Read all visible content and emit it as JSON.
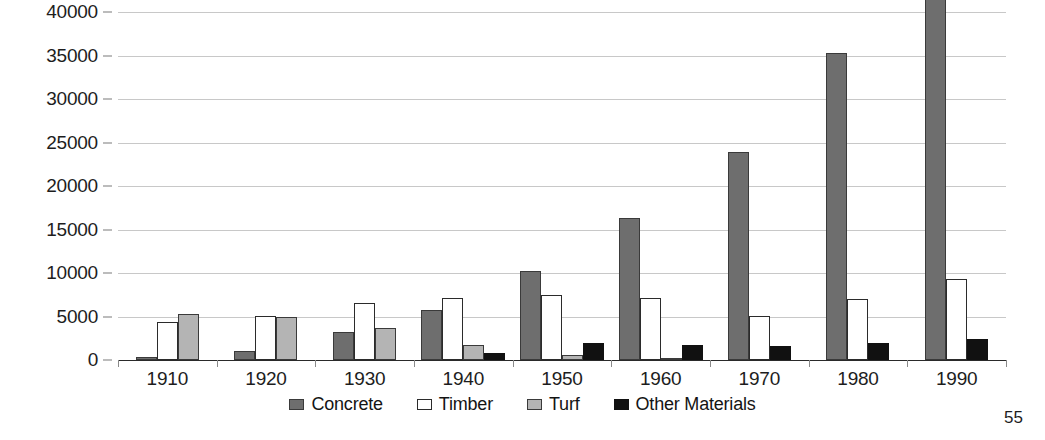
{
  "page": {
    "page_number": "55"
  },
  "chart_data": {
    "type": "bar",
    "title": "",
    "subtitle": "",
    "xlabel": "",
    "ylabel": "",
    "grid": true,
    "legend_position": "bottom",
    "ylim": [
      0,
      40000
    ],
    "yticks": [
      0,
      5000,
      10000,
      15000,
      20000,
      25000,
      30000,
      35000,
      40000
    ],
    "ytick_labels": [
      "0",
      "5000",
      "10000",
      "15000",
      "20000",
      "25000",
      "30000",
      "35000",
      "40000"
    ],
    "categories": [
      "1910",
      "1920",
      "1930",
      "1940",
      "1950",
      "1960",
      "1970",
      "1980",
      "1990"
    ],
    "series": [
      {
        "name": "Concrete",
        "color": "#6e6e6e",
        "values": [
          300,
          1000,
          3200,
          5800,
          10200,
          16300,
          23900,
          35300,
          42700
        ]
      },
      {
        "name": "Timber",
        "color": "#ffffff",
        "values": [
          4400,
          5100,
          6600,
          7100,
          7500,
          7100,
          5100,
          7000,
          9300
        ]
      },
      {
        "name": "Turf",
        "color": "#b4b4b4",
        "values": [
          5300,
          4900,
          3700,
          1700,
          600,
          200,
          0,
          0,
          0
        ]
      },
      {
        "name": "Other Materials",
        "color": "#111111",
        "values": [
          0,
          0,
          0,
          800,
          1900,
          1700,
          1600,
          2000,
          2400
        ]
      }
    ]
  }
}
